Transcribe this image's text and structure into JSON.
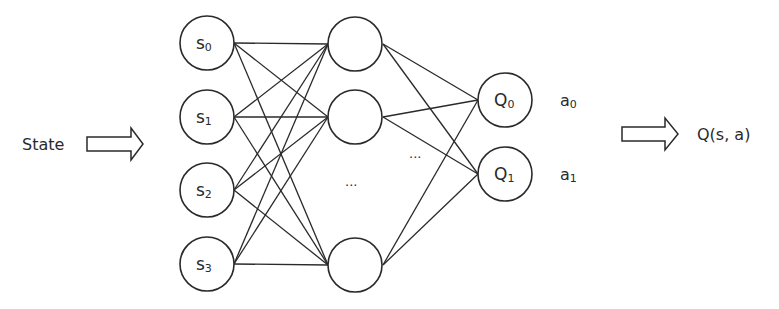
{
  "diagram": {
    "input_label": "State",
    "output_label": "Q(s, a)",
    "colors": {
      "stroke": "#2a2a2a",
      "fill": "#ffffff",
      "background": "#ffffff"
    },
    "layers": {
      "input": {
        "nodes": [
          {
            "base": "s",
            "sub": "0"
          },
          {
            "base": "s",
            "sub": "1"
          },
          {
            "base": "s",
            "sub": "2"
          },
          {
            "base": "s",
            "sub": "3"
          }
        ]
      },
      "hidden": {
        "nodes": [
          {
            "base": "",
            "sub": ""
          },
          {
            "base": "",
            "sub": ""
          },
          {
            "base": "",
            "sub": ""
          }
        ],
        "ellipsis": "..."
      },
      "output": {
        "nodes": [
          {
            "base": "Q",
            "sub": "0"
          },
          {
            "base": "Q",
            "sub": "1"
          }
        ],
        "ellipsis": "..."
      }
    },
    "actions": [
      {
        "base": "a",
        "sub": "0"
      },
      {
        "base": "a",
        "sub": "1"
      }
    ]
  }
}
